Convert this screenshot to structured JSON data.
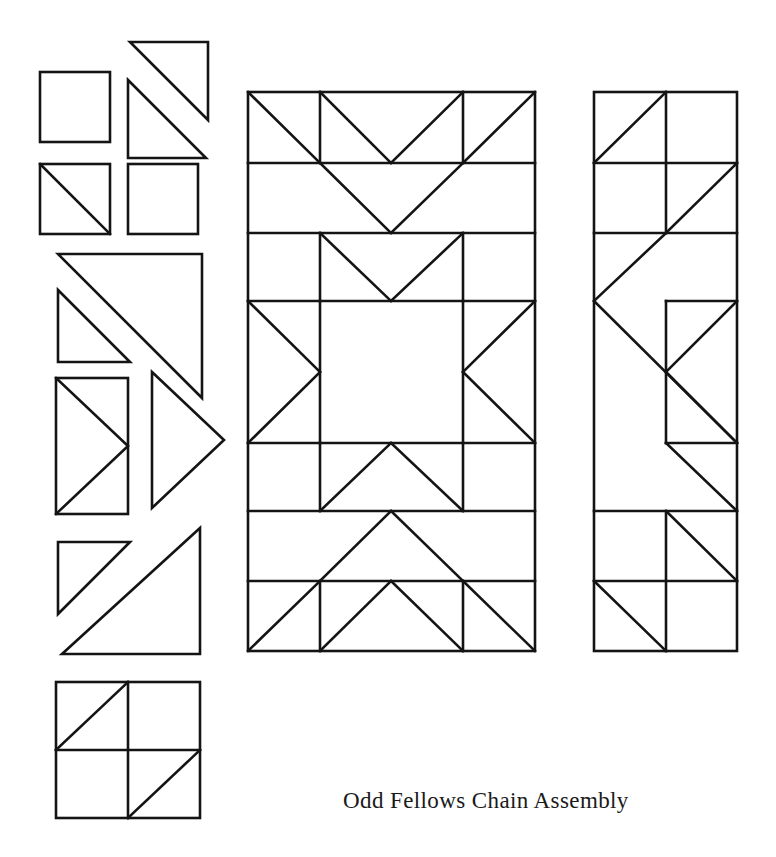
{
  "document": {
    "title": "Odd Fellows Chain Assembly",
    "background_color": "#ffffff",
    "line_color": "#141414",
    "width": 776,
    "height": 857
  },
  "caption": {
    "text": "Odd Fellows Chain Assembly",
    "x": 343,
    "y": 808,
    "font_size": 23,
    "color": "#1a1a1a"
  },
  "legend_pieces": {
    "label": "Pattern piece key",
    "items": [
      {
        "name": "plain-square-large",
        "shape": "square",
        "x": 40,
        "y": 72,
        "w": 70,
        "h": 70
      },
      {
        "name": "half-square-triangle-upper-right",
        "shape": "right-triangle",
        "orientation": "hypotenuse-top-left-to-bottom-right",
        "x": 128,
        "y": 40,
        "w": 78,
        "h": 78
      },
      {
        "name": "half-square-triangle-lower-left",
        "shape": "right-triangle",
        "orientation": "hypotenuse-top-left-to-bottom-right",
        "x": 128,
        "y": 78,
        "w": 78,
        "h": 78
      },
      {
        "name": "half-square-triangle-diagonal-square",
        "shape": "square-with-diagonal",
        "x": 40,
        "y": 164,
        "w": 70,
        "h": 70
      },
      {
        "name": "plain-square-small",
        "shape": "square",
        "x": 128,
        "y": 164,
        "w": 70,
        "h": 70
      },
      {
        "name": "large-triangle-top",
        "shape": "right-triangle",
        "x": 58,
        "y": 252,
        "w": 144,
        "h": 144
      },
      {
        "name": "small-triangle-nested",
        "shape": "right-triangle",
        "x": 58,
        "y": 288,
        "w": 72,
        "h": 72
      },
      {
        "name": "flying-geese-rectangle",
        "shape": "rectangle-with-point",
        "x": 56,
        "y": 376,
        "w": 72,
        "h": 140
      },
      {
        "name": "point-triangle-right",
        "shape": "isoceles-triangle-right-pointing",
        "x": 152,
        "y": 368,
        "w": 72,
        "h": 144
      },
      {
        "name": "small-triangle-bottom",
        "shape": "right-triangle",
        "x": 58,
        "y": 530,
        "w": 72,
        "h": 72
      },
      {
        "name": "large-triangle-bottom",
        "shape": "right-triangle",
        "x": 98,
        "y": 520,
        "w": 144,
        "h": 144
      },
      {
        "name": "chain-block-four-patch",
        "shape": "four-patch-with-diagonals",
        "x": 56,
        "y": 680,
        "w": 144,
        "h": 138
      }
    ]
  },
  "center_block": {
    "name": "Odd Fellows Chain center block",
    "x": 248,
    "y": 92,
    "width": 287,
    "height": 559,
    "columns": [
      248,
      320,
      463,
      535
    ],
    "rows": [
      92,
      163,
      233,
      301,
      443,
      511,
      581,
      651
    ]
  },
  "side_strip": {
    "name": "Odd Fellows Chain side strip",
    "x": 594,
    "y": 92,
    "width": 143,
    "height": 559,
    "columns": [
      594,
      666,
      737
    ],
    "rows": [
      92,
      163,
      233,
      301,
      443,
      511,
      581,
      651
    ]
  }
}
